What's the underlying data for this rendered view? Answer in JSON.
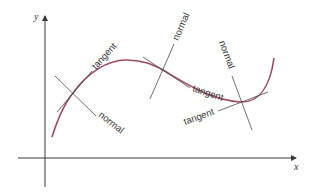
{
  "diagram": {
    "axes": {
      "x_label": "x",
      "y_label": "y"
    },
    "points": [
      {
        "tangent_label": "tangent",
        "normal_label": "normal"
      },
      {
        "tangent_label": "tangent",
        "normal_label": "normal"
      },
      {
        "tangent_label": "tangent",
        "normal_label": "normal"
      }
    ],
    "colors": {
      "curve": "#9b4a5c",
      "lines": "#4a4a4a",
      "axes": "#3a3a3a"
    }
  }
}
